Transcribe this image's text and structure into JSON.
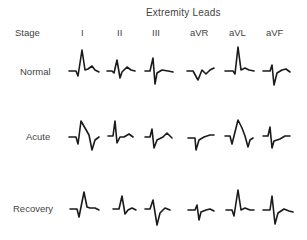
{
  "figure": {
    "title": "Extremity Leads",
    "stage_header": "Stage",
    "leads": [
      "I",
      "II",
      "III",
      "aVR",
      "aVL",
      "aVF"
    ],
    "stages": [
      "Normal",
      "Acute",
      "Recovery"
    ],
    "line_color": "#1a1a1a",
    "waveforms": {
      "Normal": [
        "upright QRS, upright T",
        "upright QRS, upright T",
        "deep S, upright T",
        "inverted QRS, inverted T",
        "tall R, upright T",
        "deep S, upright T"
      ],
      "Acute": [
        "ST elevation",
        "upright QRS, small T",
        "small QRS, upright T",
        "deep Q, ST depression",
        "ST elevation",
        "ST depression"
      ],
      "Recovery": [
        "upright QRS, flat T",
        "upright QRS, flat T",
        "deep S, inverted T",
        "inverted QRS",
        "tall R, flat T",
        "deep S, inverted T"
      ]
    }
  }
}
